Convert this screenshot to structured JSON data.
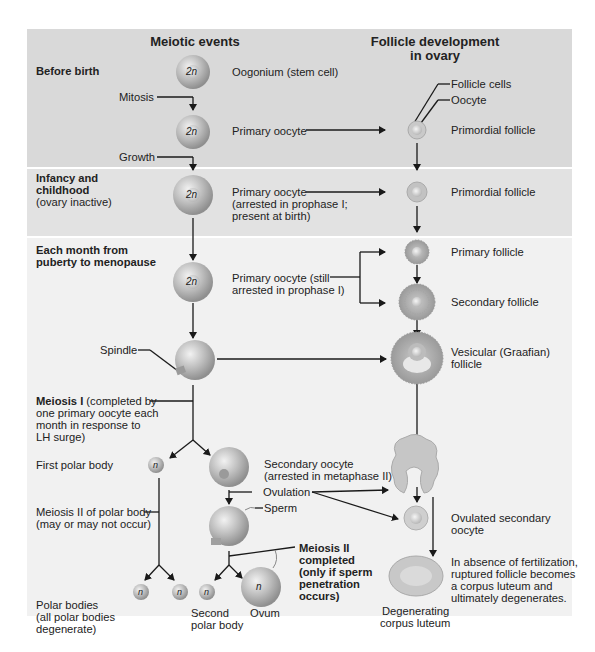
{
  "headers": {
    "meiotic": "Meiotic events",
    "follicle_line1": "Follicle development",
    "follicle_line2": "in ovary"
  },
  "stages": {
    "before_birth": "Before birth",
    "infancy_line1": "Infancy and",
    "infancy_line2": "childhood",
    "infancy_note": "(ovary inactive)",
    "monthly_line1": "Each month from",
    "monthly_line2": "puberty to menopause"
  },
  "cells": {
    "diploid": "2n",
    "haploid": "n"
  },
  "meiotic_labels": {
    "oogonium": "Oogonium (stem cell)",
    "mitosis": "Mitosis",
    "primary_oocyte": "Primary oocyte",
    "growth": "Growth",
    "arrested_1": "Primary oocyte",
    "arrested_2": "(arrested in prophase I;",
    "arrested_3": "present at birth)",
    "still_1": "Primary oocyte (still",
    "still_2": "arrested in prophase I)",
    "spindle": "Spindle",
    "meiosis1_bold": "Meiosis I",
    "meiosis1_1": " (completed by",
    "meiosis1_2": "one primary oocyte each",
    "meiosis1_3": "month in response to",
    "meiosis1_4": "LH surge)",
    "first_polar": "First polar body",
    "secondary_1": "Secondary oocyte",
    "secondary_2": "(arrested in metaphase II)",
    "ovulation": "Ovulation",
    "sperm": "Sperm",
    "meiosis2_polar_1": "Meiosis II of polar body",
    "meiosis2_polar_2": "(may or may not occur)",
    "meiosis2_done_1": "Meiosis II",
    "meiosis2_done_2": "completed",
    "meiosis2_done_3": "(only if sperm",
    "meiosis2_done_4": "penetration",
    "meiosis2_done_5": "occurs)",
    "polar_bodies_1": "Polar bodies",
    "polar_bodies_2": "(all polar bodies",
    "polar_bodies_3": "degenerate)",
    "second_polar_1": "Second",
    "second_polar_2": "polar body",
    "ovum": "Ovum"
  },
  "follicle_labels": {
    "follicle_cells": "Follicle cells",
    "oocyte": "Oocyte",
    "primordial_1": "Primordial follicle",
    "primordial_2": "Primordial follicle",
    "primary": "Primary follicle",
    "secondary": "Secondary follicle",
    "vesicular_1": "Vesicular (Graafian)",
    "vesicular_2": "follicle",
    "ovulated_1": "Ovulated secondary",
    "ovulated_2": "oocyte",
    "absence_1": "In absence of fertilization,",
    "absence_2": "ruptured follicle becomes",
    "absence_3": "a corpus luteum and",
    "absence_4": "ultimately degenerates.",
    "degenerating_1": "Degenerating",
    "degenerating_2": "corpus luteum"
  },
  "colors": {
    "band_before_birth": "#d9d9d9",
    "band_infancy": "#e2e2e2",
    "band_monthly": "#f1f1f1",
    "cell": "#b5b5b5",
    "arrow": "#1a1a1a"
  }
}
